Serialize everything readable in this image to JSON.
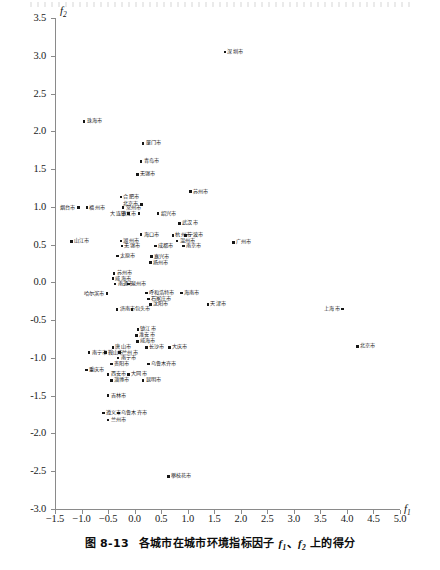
{
  "caption": {
    "number": "图 8-13",
    "text_before": "各城市在城市环境指标因子 ",
    "f1": "f",
    "f1_sub": "1",
    "sep": "、",
    "f2": "f",
    "f2_sub": "2",
    "text_after": " 上的得分"
  },
  "chart_data": {
    "type": "scatter",
    "title": "各城市在城市环境指标因子 f1、f2 上的得分",
    "xlabel": "f1",
    "ylabel": "f2",
    "xlim": [
      -1.5,
      5.0
    ],
    "ylim": [
      -3.0,
      3.5
    ],
    "xticks": [
      "-1.5",
      "-1.0",
      "-0.5",
      "0.0",
      "0.5",
      "1.0",
      "1.5",
      "2.0",
      "2.5",
      "3.0",
      "3.5",
      "4.0",
      "4.5",
      "5.0"
    ],
    "xtick_values": [
      -1.5,
      -1.0,
      -0.5,
      0.0,
      0.5,
      1.0,
      1.5,
      2.0,
      2.5,
      3.0,
      3.5,
      4.0,
      4.5,
      5.0
    ],
    "yticks": [
      "3.5",
      "3.0",
      "2.5",
      "2.0",
      "1.5",
      "1.0",
      "0.5",
      "0.0",
      "-0.5",
      "-1.0",
      "-1.5",
      "-2.0",
      "-2.5",
      "-3.0"
    ],
    "ytick_values": [
      3.5,
      3.0,
      2.5,
      2.0,
      1.5,
      1.0,
      0.5,
      0.0,
      -0.5,
      -1.0,
      -1.5,
      -2.0,
      -2.5,
      -3.0
    ],
    "grid": false,
    "legend": null,
    "marker_color": "#161616",
    "axis_color": "#8a8a8a",
    "points": [
      {
        "label": "深圳市",
        "x": 1.7,
        "y": 3.05,
        "side": "right"
      },
      {
        "label": "珠海市",
        "x": -0.95,
        "y": 2.13,
        "side": "right"
      },
      {
        "label": "厦门市",
        "x": 0.16,
        "y": 1.84,
        "side": "right"
      },
      {
        "label": "青岛市",
        "x": 0.12,
        "y": 1.6,
        "side": "right"
      },
      {
        "label": "无锡市",
        "x": 0.05,
        "y": 1.43,
        "side": "right"
      },
      {
        "label": "苏州市",
        "x": 1.05,
        "y": 1.2,
        "side": "right"
      },
      {
        "label": "合肥市",
        "x": -0.26,
        "y": 1.13,
        "side": "right"
      },
      {
        "label": "常州市",
        "x": -0.22,
        "y": 0.99,
        "side": "right"
      },
      {
        "label": "烟台市",
        "x": -1.06,
        "y": 0.99,
        "side": "left"
      },
      {
        "label": "福州市",
        "x": -0.9,
        "y": 0.99,
        "side": "right"
      },
      {
        "label": "北京市",
        "x": 0.13,
        "y": 1.03,
        "side": "left"
      },
      {
        "label": "大连市",
        "x": -0.11,
        "y": 0.91,
        "side": "left"
      },
      {
        "label": "镇江市",
        "x": 0.08,
        "y": 0.91,
        "side": "left"
      },
      {
        "label": "绍兴市",
        "x": 0.44,
        "y": 0.91,
        "side": "right"
      },
      {
        "label": "武汉市",
        "x": 0.85,
        "y": 0.78,
        "side": "right"
      },
      {
        "label": "海口市",
        "x": 0.12,
        "y": 0.63,
        "side": "right"
      },
      {
        "label": "杭州市",
        "x": 0.72,
        "y": 0.62,
        "side": "right"
      },
      {
        "label": "宁波市",
        "x": 0.96,
        "y": 0.62,
        "side": "right"
      },
      {
        "label": "山江市",
        "x": -1.19,
        "y": 0.54,
        "side": "right"
      },
      {
        "label": "湖州市",
        "x": -0.26,
        "y": 0.55,
        "side": "right"
      },
      {
        "label": "温州市",
        "x": 0.8,
        "y": 0.55,
        "side": "right"
      },
      {
        "label": "无锡市",
        "x": -0.24,
        "y": 0.48,
        "side": "right"
      },
      {
        "label": "成都市",
        "x": 0.39,
        "y": 0.48,
        "side": "right"
      },
      {
        "label": "南京市",
        "x": 0.92,
        "y": 0.48,
        "side": "right"
      },
      {
        "label": "广州市",
        "x": 1.86,
        "y": 0.53,
        "side": "right"
      },
      {
        "label": "太原市",
        "x": -0.32,
        "y": 0.35,
        "side": "right"
      },
      {
        "label": "嘉兴市",
        "x": 0.32,
        "y": 0.34,
        "side": "right"
      },
      {
        "label": "扬州市",
        "x": 0.3,
        "y": 0.26,
        "side": "right"
      },
      {
        "label": "苏州市",
        "x": -0.39,
        "y": 0.12,
        "side": "right"
      },
      {
        "label": "威海市",
        "x": -0.41,
        "y": 0.05,
        "side": "right"
      },
      {
        "label": "南通市",
        "x": -0.37,
        "y": -0.02,
        "side": "right"
      },
      {
        "label": "泉州市",
        "x": -0.12,
        "y": -0.02,
        "side": "right"
      },
      {
        "label": "呼和浩特市",
        "x": 0.22,
        "y": -0.14,
        "side": "right"
      },
      {
        "label": "石家庄市",
        "x": 0.26,
        "y": -0.22,
        "side": "right"
      },
      {
        "label": "沈阳市",
        "x": 0.3,
        "y": -0.29,
        "side": "right"
      },
      {
        "label": "海南市",
        "x": 0.88,
        "y": -0.14,
        "side": "right"
      },
      {
        "label": "哈尔滨市",
        "x": -0.52,
        "y": -0.15,
        "side": "left"
      },
      {
        "label": "天津市",
        "x": 1.38,
        "y": -0.29,
        "side": "right"
      },
      {
        "label": "上海市",
        "x": 3.92,
        "y": -0.35,
        "side": "left"
      },
      {
        "label": "济南市",
        "x": -0.33,
        "y": -0.36,
        "side": "right"
      },
      {
        "label": "包头市",
        "x": -0.05,
        "y": -0.36,
        "side": "right"
      },
      {
        "label": "镇江市",
        "x": 0.06,
        "y": -0.62,
        "side": "right"
      },
      {
        "label": "淮安市",
        "x": 0.04,
        "y": -0.7,
        "side": "right"
      },
      {
        "label": "威海市",
        "x": 0.05,
        "y": -0.78,
        "side": "right"
      },
      {
        "label": "唐山市",
        "x": -0.41,
        "y": -0.86,
        "side": "right"
      },
      {
        "label": "长沙市",
        "x": 0.22,
        "y": -0.86,
        "side": "right"
      },
      {
        "label": "大庆市",
        "x": 0.66,
        "y": -0.86,
        "side": "right"
      },
      {
        "label": "北京市",
        "x": 4.2,
        "y": -0.85,
        "side": "right"
      },
      {
        "label": "南宁市",
        "x": -0.86,
        "y": -0.93,
        "side": "right"
      },
      {
        "label": "鞍山市",
        "x": -0.55,
        "y": -0.93,
        "side": "right"
      },
      {
        "label": "兰州市",
        "x": -0.28,
        "y": -0.93,
        "side": "right"
      },
      {
        "label": "南宁市",
        "x": -0.31,
        "y": -1.0,
        "side": "right"
      },
      {
        "label": "贵阳市",
        "x": -0.44,
        "y": -1.08,
        "side": "right"
      },
      {
        "label": "乌鲁木齐市",
        "x": 0.26,
        "y": -1.08,
        "side": "right"
      },
      {
        "label": "重庆市",
        "x": -0.91,
        "y": -1.16,
        "side": "right"
      },
      {
        "label": "西安市",
        "x": -0.5,
        "y": -1.22,
        "side": "right"
      },
      {
        "label": "大同市",
        "x": -0.11,
        "y": -1.22,
        "side": "right"
      },
      {
        "label": "淄博市",
        "x": -0.44,
        "y": -1.3,
        "side": "right"
      },
      {
        "label": "昆明市",
        "x": 0.16,
        "y": -1.3,
        "side": "right"
      },
      {
        "label": "吉林市",
        "x": -0.5,
        "y": -1.5,
        "side": "right"
      },
      {
        "label": "遵义市",
        "x": -0.59,
        "y": -1.73,
        "side": "right"
      },
      {
        "label": "乌鲁木齐市",
        "x": -0.3,
        "y": -1.73,
        "side": "right"
      },
      {
        "label": "兰州市",
        "x": -0.5,
        "y": -1.82,
        "side": "right"
      },
      {
        "label": "攀枝花市",
        "x": 0.64,
        "y": -2.57,
        "side": "right"
      }
    ]
  }
}
